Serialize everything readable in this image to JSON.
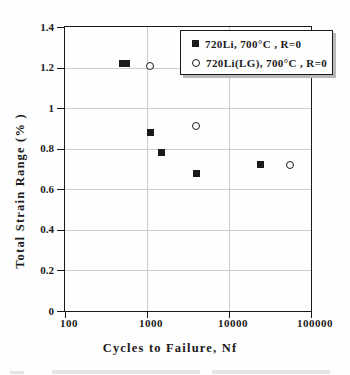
{
  "figure": {
    "kind": "scatter-plot-figure",
    "background": "#fefefe"
  },
  "chart_data": {
    "type": "scatter",
    "title": "",
    "xlabel": "Cycles to Failure, Nf",
    "ylabel": "Total Strain Range (% )",
    "x_scale": "log",
    "xlim": [
      100,
      100000
    ],
    "ylim": [
      0,
      1.4
    ],
    "grid": true,
    "legend_position": "top-right",
    "x_ticks": [
      {
        "label": "100",
        "value": 100
      },
      {
        "label": "1000",
        "value": 1000
      },
      {
        "label": "10000",
        "value": 10000
      },
      {
        "label": "100000",
        "value": 100000
      }
    ],
    "y_ticks": [
      {
        "label": "1.4",
        "value": 1.4
      },
      {
        "label": "1.2",
        "value": 1.2
      },
      {
        "label": "1",
        "value": 1.0
      },
      {
        "label": "0.8",
        "value": 0.8
      },
      {
        "label": "0.6",
        "value": 0.6
      },
      {
        "label": "0.4",
        "value": 0.4
      },
      {
        "label": "0.2",
        "value": 0.2
      },
      {
        "label": "0",
        "value": 0
      }
    ],
    "x_gridlines": [
      1000,
      10000
    ],
    "y_gridlines": [
      0.2,
      0.4,
      0.6,
      0.8,
      1.0,
      1.2
    ],
    "series": [
      {
        "name": "720Li, 700°C , R=0",
        "marker": "filled-square",
        "color": "#1a1a1a",
        "points": [
          [
            500,
            1.22
          ],
          [
            560,
            1.22
          ],
          [
            1100,
            0.88
          ],
          [
            1500,
            0.78
          ],
          [
            4000,
            0.68
          ],
          [
            24000,
            0.72
          ]
        ]
      },
      {
        "name": "720Li(LG), 700°C , R=0",
        "marker": "open-circle",
        "color": "#1a1a1a",
        "points": [
          [
            1100,
            1.21
          ],
          [
            4000,
            0.91
          ],
          [
            55000,
            0.72
          ]
        ]
      }
    ]
  },
  "colors": {
    "axis": "#1a1a1a",
    "grid": "#cccccc",
    "marker": "#1a1a1a",
    "legend_shadow": "#b8b8b8",
    "background": "#fefefe"
  }
}
